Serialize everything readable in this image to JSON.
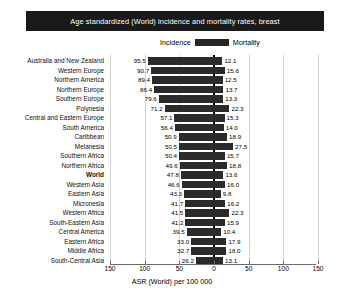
{
  "title": "Age standardized (World) incidence and mortality rates, breast",
  "legend": {
    "incidence_label": "Incidence",
    "mortality_label": "Mortality",
    "swatch_color": "#262626"
  },
  "axis": {
    "xlabel": "ASR (World) per 100 000",
    "ticks": [
      "150",
      "100",
      "50",
      "0",
      "50",
      "100",
      "150"
    ],
    "tick_values": [
      -150,
      -100,
      -50,
      0,
      50,
      100,
      150
    ]
  },
  "colors": {
    "bar": "#2b2b2b",
    "title_bg": "#1a1a1a",
    "title_fg": "#ffffff",
    "grid": "#d3d3d3",
    "axis": "#6b6b6b"
  },
  "chart_data": {
    "type": "bar",
    "orientation": "horizontal-diverging",
    "title": "Age standardized (World) incidence and mortality rates, breast",
    "xlabel": "ASR (World) per 100 000",
    "ylabel": "",
    "xlim": [
      -150,
      150
    ],
    "grid": true,
    "legend_position": "top-center",
    "categories": [
      "Australia and New Zealand",
      "Western Europe",
      "Northern America",
      "Northern Europe",
      "Southern Europe",
      "Polynesia",
      "Central and Eastern Europe",
      "South America",
      "Caribbean",
      "Melanesia",
      "Southern Africa",
      "Northern Africa",
      "World",
      "Western Asia",
      "Eastern Asia",
      "Micronesia",
      "Western Africa",
      "South-Eastern Asia",
      "Central America",
      "Eastern Africa",
      "Middle Africa",
      "South-Central Asia"
    ],
    "highlight_category": "World",
    "series": [
      {
        "name": "Incidence",
        "side": "left",
        "values": [
          95.5,
          90.7,
          89.4,
          86.4,
          79.6,
          71.2,
          57.1,
          56.4,
          50.9,
          50.5,
          50.4,
          49.6,
          47.8,
          46.6,
          43.3,
          41.7,
          41.5,
          41.2,
          39.5,
          33.0,
          32.7,
          26.2
        ],
        "labels": [
          "95.5",
          "90.7",
          "89.4",
          "86.4",
          "79.6",
          "71.2",
          "57.1",
          "56.4",
          "50.9",
          "50.5",
          "50.4",
          "49.6",
          "47.8",
          "46.6",
          "43.3",
          "41.7",
          "41.5",
          "41.2",
          "39.5",
          "33.0",
          "32.7",
          "26.2"
        ]
      },
      {
        "name": "Mortality",
        "side": "right",
        "values": [
          12.1,
          15.6,
          12.5,
          13.7,
          13.3,
          22.3,
          15.3,
          14.0,
          18.9,
          27.5,
          15.7,
          18.8,
          13.6,
          16.0,
          9.8,
          16.2,
          22.3,
          15.9,
          10.4,
          17.9,
          18.0,
          13.1
        ],
        "labels": [
          "12.1",
          "15.6",
          "12.5",
          "13.7",
          "13.3",
          "22.3",
          "15.3",
          "14.0",
          "18.9",
          "27.5",
          "15.7",
          "18.8",
          "13.6",
          "16.0",
          "9.8",
          "16.2",
          "22.3",
          "15.9",
          "10.4",
          "17.9",
          "18.0",
          "13.1"
        ]
      }
    ]
  }
}
